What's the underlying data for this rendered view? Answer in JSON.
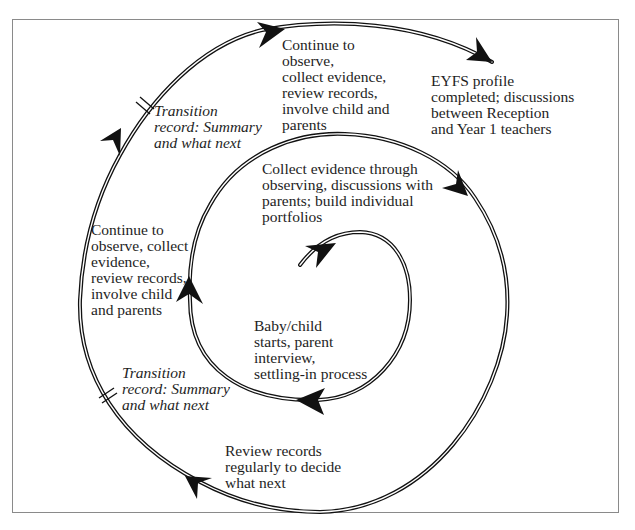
{
  "diagram": {
    "type": "spiral-cycle",
    "title": "",
    "stages": [
      {
        "id": "start",
        "text": "Baby/child\nstarts, parent\ninterview,\nsettling-in process"
      },
      {
        "id": "collect",
        "text": "Collect evidence through\nobserving, discussions with\nparents; build individual\nportfolios"
      },
      {
        "id": "continue_left",
        "text": "Continue to\nobserve, collect\nevidence,\nreview records,\ninvolve child\nand parents"
      },
      {
        "id": "transition_lower",
        "text": "Transition\nrecord: Summary\nand what next"
      },
      {
        "id": "review",
        "text": "Review records\nregularly to decide\nwhat next"
      },
      {
        "id": "transition_upper",
        "text": "Transition\nrecord: Summary\nand what next"
      },
      {
        "id": "continue_top",
        "text": "Continue to\nobserve,\ncollect evidence,\nreview records,\ninvolve child and\nparents"
      },
      {
        "id": "eyfs",
        "text": "EYFS profile\ncompleted; discussions\nbetween Reception\nand Year 1 teachers"
      }
    ],
    "markers": [
      {
        "name": "transition-marker-upper",
        "glyph": "double-tick"
      },
      {
        "name": "transition-marker-lower",
        "glyph": "double-tick"
      }
    ],
    "colors": {
      "line": "#111111",
      "frame": "#8a8a8a",
      "text": "#1e1e1e"
    }
  }
}
